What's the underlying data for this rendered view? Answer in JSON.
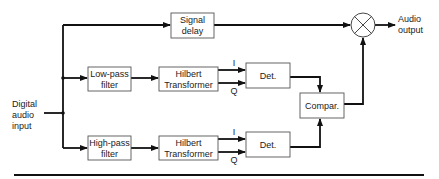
{
  "diagram": {
    "input_label": [
      "Digital",
      "audio",
      "input"
    ],
    "output_label": [
      "Audio",
      "output"
    ],
    "blocks": {
      "signal_delay": [
        "Signal",
        "delay"
      ],
      "low_pass": [
        "Low-pass",
        "filter"
      ],
      "high_pass": [
        "High-pass",
        "filter"
      ],
      "hilbert_top": [
        "Hilbert",
        "Transformer"
      ],
      "hilbert_bottom": [
        "Hilbert",
        "Transformer"
      ],
      "det_top": "Det.",
      "det_bottom": "Det.",
      "comparator": "Compar."
    },
    "port_labels": {
      "i_top": "I",
      "q_top": "Q",
      "i_bottom": "I",
      "q_bottom": "Q"
    },
    "multiplier_icon": "circle-cross-multiplier"
  }
}
